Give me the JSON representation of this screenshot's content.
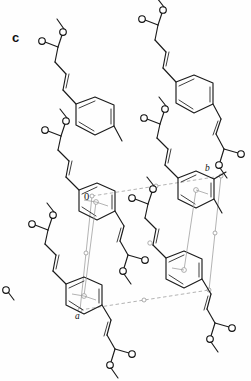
{
  "figure": {
    "panel_label": "c",
    "kind": "crystal-packing-diagram",
    "colors": {
      "bond": "#1b1b1b",
      "cell": "#9a9a9a",
      "background": "#ffffff",
      "atom_fill": "#ffffff"
    }
  },
  "unit_cell": {
    "axis_labels": [
      {
        "name": "axis-a",
        "text": "a"
      },
      {
        "name": "axis-b",
        "text": "b"
      }
    ],
    "origin_label": "0",
    "node_count": 6,
    "edge_style": "dashed-gray"
  },
  "molecules": {
    "count": 8,
    "formula_name": "methyl cinnamate",
    "fragments": {
      "aromatic_ring": "benzene",
      "linker": "CH=CH",
      "ester": "C(=O)OCH3"
    },
    "atom_labels": {
      "oxygen": "O"
    }
  }
}
